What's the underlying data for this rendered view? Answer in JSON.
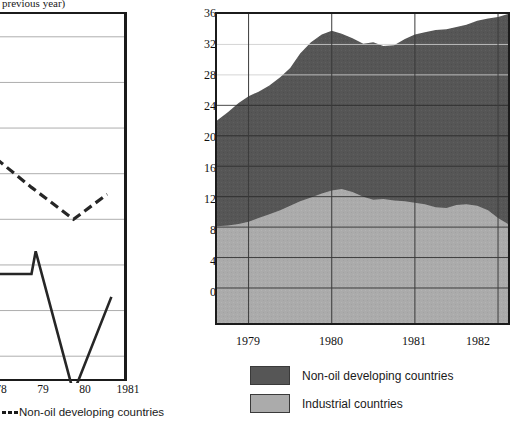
{
  "left": {
    "note": "previous year)",
    "xticks": [
      "78",
      "79",
      "80",
      "1981"
    ],
    "legend_label": "Non-oil developing countries"
  },
  "right": {
    "yticks": [
      "36",
      "32",
      "28",
      "24",
      "20",
      "16",
      "12",
      "8",
      "4",
      "0"
    ],
    "xticks": [
      "1979",
      "1980",
      "1981",
      "1982"
    ],
    "legend": [
      {
        "label": "Non-oil developing countries",
        "color": "#565656"
      },
      {
        "label": "Industrial countries",
        "color": "#ababab"
      }
    ]
  },
  "chart_data": [
    {
      "type": "line",
      "id": "left-line-chart",
      "title": "",
      "subtitle": "previous year)",
      "xlabel": "",
      "ylabel": "",
      "grid": true,
      "legend_position": "below",
      "note": "Chart is cropped at the left edge of the screenshot; only the right portion of the plot is visible.",
      "categories": [
        "78",
        "79",
        "80",
        "1981"
      ],
      "xlim": [
        77.3,
        81.2
      ],
      "ylim": [
        -5,
        11
      ],
      "yticks": [
        -4,
        -2,
        0,
        2,
        4,
        6,
        8,
        10
      ],
      "series": [
        {
          "name": "Non-oil developing countries",
          "style": "dashed",
          "color": "#1a1a1a",
          "x": [
            77.3,
            78.0,
            79.0,
            80.0,
            80.8
          ],
          "values": [
            4.2,
            4.9,
            3.4,
            2.0,
            3.1
          ]
        },
        {
          "name": "Industrial countries",
          "style": "solid",
          "color": "#1a1a1a",
          "x": [
            77.3,
            78.0,
            79.0,
            79.1,
            80.0,
            80.9
          ],
          "values": [
            4.1,
            -0.4,
            -0.4,
            0.6,
            -5.6,
            -1.4
          ]
        }
      ]
    },
    {
      "type": "area",
      "id": "right-stacked-area-chart",
      "stacked": true,
      "title": "",
      "xlabel": "",
      "ylabel": "",
      "grid": true,
      "legend_position": "below",
      "xlim": [
        1978.62,
        1982.12
      ],
      "ylim": [
        -4.6,
        36
      ],
      "yticks": [
        0,
        4,
        8,
        12,
        16,
        20,
        24,
        28,
        32,
        36
      ],
      "xticks": [
        1979,
        1980,
        1981,
        1982
      ],
      "x": [
        1978.62,
        1978.75,
        1978.88,
        1979.0,
        1979.12,
        1979.25,
        1979.38,
        1979.5,
        1979.62,
        1979.75,
        1979.88,
        1980.0,
        1980.12,
        1980.25,
        1980.38,
        1980.5,
        1980.62,
        1980.75,
        1980.88,
        1981.0,
        1981.12,
        1981.25,
        1981.38,
        1981.5,
        1981.62,
        1981.75,
        1981.88,
        1982.0,
        1982.12
      ],
      "series": [
        {
          "name": "Industrial countries",
          "color": "#ababab",
          "values": [
            8.1,
            8.2,
            8.4,
            8.7,
            9.2,
            9.7,
            10.2,
            10.8,
            11.4,
            11.9,
            12.4,
            12.8,
            13.0,
            12.6,
            12.0,
            11.6,
            11.7,
            11.5,
            11.4,
            11.2,
            11.0,
            10.6,
            10.5,
            10.9,
            11.0,
            10.8,
            10.2,
            9.2,
            8.4
          ]
        },
        {
          "name": "Non-oil developing countries",
          "color": "#565656",
          "values": [
            13.9,
            14.9,
            15.9,
            16.5,
            16.6,
            16.9,
            17.5,
            18.1,
            19.4,
            20.4,
            20.9,
            21.0,
            20.4,
            20.2,
            20.1,
            20.7,
            20.1,
            20.4,
            21.3,
            22.1,
            22.6,
            23.3,
            23.5,
            23.4,
            23.6,
            24.3,
            25.2,
            26.4,
            27.6
          ]
        }
      ],
      "totals": [
        22.0,
        23.1,
        24.3,
        25.2,
        25.8,
        26.6,
        27.7,
        28.9,
        30.8,
        32.3,
        33.3,
        33.8,
        33.4,
        32.8,
        32.1,
        32.3,
        31.8,
        31.9,
        32.7,
        33.3,
        33.6,
        33.9,
        34.0,
        34.3,
        34.6,
        35.1,
        35.4,
        35.6,
        36.0
      ]
    }
  ]
}
